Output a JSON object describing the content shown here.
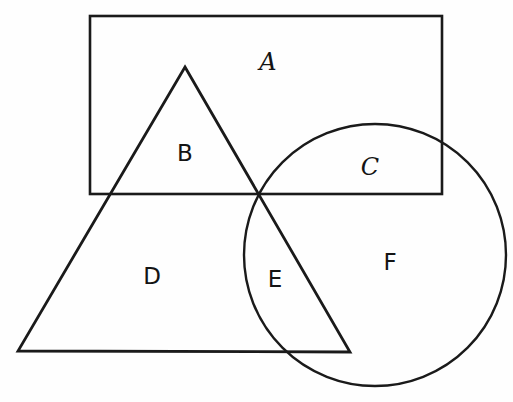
{
  "diagram": {
    "background_color": "#fefefe",
    "stroke_color": "#1a1a1a",
    "width": 513,
    "height": 402,
    "shapes": [
      {
        "name": "rectangle",
        "type": "rect",
        "x": 90,
        "y": 16,
        "width": 352,
        "height": 178,
        "stroke_width": 2.6
      },
      {
        "name": "triangle",
        "type": "polygon",
        "points": "185,67 350,352 18,351",
        "stroke_width": 2.8
      },
      {
        "name": "circle",
        "type": "circle",
        "cx": 375,
        "cy": 255,
        "r": 131,
        "stroke_width": 2.4
      }
    ],
    "labels": [
      {
        "text": "A",
        "x": 268,
        "y": 62,
        "style": "italic",
        "region": "rectangle-only"
      },
      {
        "text": "B",
        "x": 185,
        "y": 153,
        "style": "upright",
        "region": "rectangle-and-triangle"
      },
      {
        "text": "C",
        "x": 370,
        "y": 167,
        "style": "italic",
        "region": "rectangle-and-circle"
      },
      {
        "text": "D",
        "x": 152,
        "y": 276,
        "style": "upright",
        "region": "triangle-only"
      },
      {
        "text": "E",
        "x": 275,
        "y": 279,
        "style": "upright",
        "region": "triangle-and-circle"
      },
      {
        "text": "F",
        "x": 390,
        "y": 262,
        "style": "upright",
        "region": "circle-only"
      }
    ]
  }
}
